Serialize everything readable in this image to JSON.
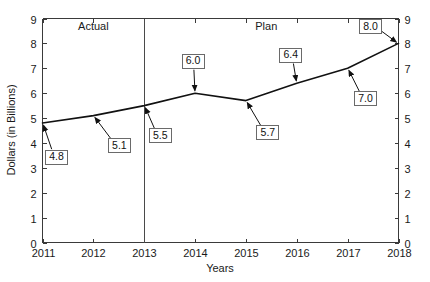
{
  "chart_data": {
    "type": "line",
    "title": "",
    "xlabel": "Years",
    "ylabel": "Dollars (in Billions)",
    "x": [
      2011,
      2012,
      2013,
      2014,
      2015,
      2016,
      2017,
      2018
    ],
    "categories": [
      "2011",
      "2012",
      "2013",
      "2014",
      "2015",
      "2016",
      "2017",
      "2018"
    ],
    "values": [
      4.8,
      5.1,
      5.5,
      6.0,
      5.7,
      6.4,
      7.0,
      8.0
    ],
    "point_labels": [
      "4.8",
      "5.1",
      "5.5",
      "6.0",
      "5.7",
      "6.4",
      "7.0",
      "8.0"
    ],
    "series": [
      {
        "name": "Dollars (in Billions)",
        "values": [
          4.8,
          5.1,
          5.5,
          6.0,
          5.7,
          6.4,
          7.0,
          8.0
        ]
      }
    ],
    "xlim": [
      2011,
      2018
    ],
    "ylim": [
      0,
      9
    ],
    "ytick_labels": [
      "0",
      "1",
      "2",
      "3",
      "4",
      "5",
      "6",
      "7",
      "8",
      "9"
    ],
    "ytick_values": [
      0,
      1,
      2,
      3,
      4,
      5,
      6,
      7,
      8,
      9
    ],
    "xtick_labels": [
      "2011",
      "2012",
      "2013",
      "2014",
      "2015",
      "2016",
      "2017",
      "2018"
    ],
    "grid": false,
    "legend": "none",
    "dual_y_axis": true,
    "annotations": [
      {
        "name": "actual-region-label",
        "text": "Actual",
        "x": 2012.0,
        "y": 8.55
      },
      {
        "name": "plan-region-label",
        "text": "Plan",
        "x": 2015.4,
        "y": 8.55
      }
    ],
    "divider": {
      "name": "actual-plan-divider",
      "x": 2013,
      "label": ""
    },
    "line_color": "#111111",
    "axis_color": "#3a3a3a",
    "background_color": "#ffffff"
  }
}
